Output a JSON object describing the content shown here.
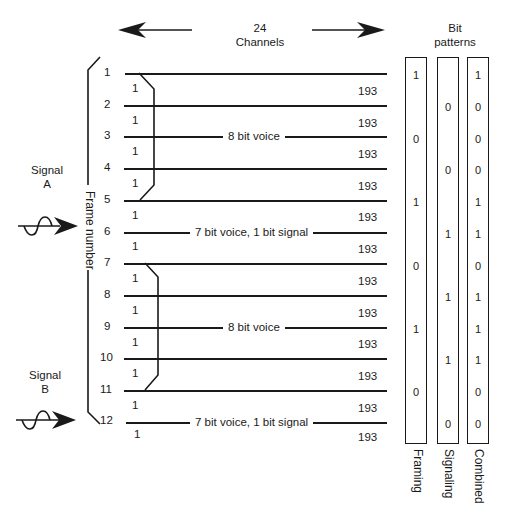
{
  "header": {
    "channels_count": "24",
    "channels_label": "Channels",
    "bit_patterns_line1": "Bit",
    "bit_patterns_line2": "patterns"
  },
  "frame_axis_label": "Frame number",
  "signals": [
    {
      "line1": "Signal",
      "line2": "A"
    },
    {
      "line1": "Signal",
      "line2": "B"
    }
  ],
  "frames": [
    {
      "number": "1",
      "start_bit": "1",
      "end_bit": "193"
    },
    {
      "number": "2",
      "start_bit": "1",
      "end_bit": "193"
    },
    {
      "number": "3",
      "start_bit": "1",
      "end_bit": "193"
    },
    {
      "number": "4",
      "start_bit": "1",
      "end_bit": "193"
    },
    {
      "number": "5",
      "start_bit": "1",
      "end_bit": "193"
    },
    {
      "number": "6",
      "start_bit": "1",
      "end_bit": "193"
    },
    {
      "number": "7",
      "start_bit": "1",
      "end_bit": "193"
    },
    {
      "number": "8",
      "start_bit": "1",
      "end_bit": "193"
    },
    {
      "number": "9",
      "start_bit": "1",
      "end_bit": "193"
    },
    {
      "number": "10",
      "start_bit": "1",
      "end_bit": "193"
    },
    {
      "number": "11",
      "start_bit": "1",
      "end_bit": "193"
    },
    {
      "number": "12",
      "start_bit": "1",
      "end_bit": "193"
    }
  ],
  "frame_annotations": [
    {
      "frame": "3",
      "text": "8 bit voice"
    },
    {
      "frame": "6",
      "text": "7 bit voice, 1 bit signal"
    },
    {
      "frame": "9",
      "text": "8 bit voice"
    },
    {
      "frame": "12",
      "text": "7 bit voice, 1 bit signal"
    }
  ],
  "bit_columns": [
    {
      "label": "Framing",
      "bits": [
        "1",
        "",
        "0",
        "",
        "1",
        "",
        "0",
        "",
        "1",
        "",
        "0",
        ""
      ]
    },
    {
      "label": "Signaling",
      "bits": [
        "",
        "0",
        "",
        "0",
        "",
        "1",
        "",
        "1",
        "",
        "1",
        "",
        "0"
      ]
    },
    {
      "label": "Combined",
      "bits": [
        "1",
        "0",
        "0",
        "0",
        "1",
        "1",
        "0",
        "1",
        "1",
        "1",
        "0",
        "0"
      ]
    }
  ],
  "colors": {
    "ink": "#1a1a1a",
    "background": "#ffffff"
  }
}
